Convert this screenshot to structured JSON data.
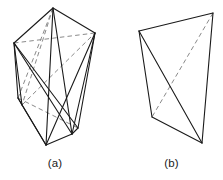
{
  "figure": {
    "background_color": "#ffffff",
    "solid_edge_color": "#1a1a1a",
    "hidden_edge_color": "#8a8a8a",
    "caption_a": "(a)",
    "caption_b": "(b)",
    "panels": [
      {
        "id": "a",
        "label": "(a)",
        "description": "wireframe polyhedron with visible and hidden edges",
        "vertices": [
          {
            "name": "apex",
            "x": 53,
            "y": 8
          },
          {
            "name": "left-upper",
            "x": 14,
            "y": 43
          },
          {
            "name": "right-upper",
            "x": 95,
            "y": 33
          },
          {
            "name": "left-lower",
            "x": 22,
            "y": 105
          },
          {
            "name": "bottom-left",
            "x": 46,
            "y": 145
          },
          {
            "name": "bottom-right",
            "x": 72,
            "y": 134
          },
          {
            "name": "left-mid",
            "x": 18,
            "y": 98
          },
          {
            "name": "right-lower",
            "x": 78,
            "y": 128
          }
        ],
        "solid_edges": [
          [
            53,
            8,
            14,
            43
          ],
          [
            53,
            8,
            95,
            33
          ],
          [
            53,
            8,
            46,
            145
          ],
          [
            53,
            8,
            72,
            134
          ],
          [
            14,
            43,
            22,
            105
          ],
          [
            14,
            43,
            18,
            98
          ],
          [
            14,
            43,
            72,
            134
          ],
          [
            14,
            43,
            78,
            128
          ],
          [
            95,
            33,
            78,
            128
          ],
          [
            95,
            33,
            46,
            145
          ],
          [
            22,
            105,
            46,
            145
          ],
          [
            18,
            98,
            46,
            145
          ],
          [
            46,
            145,
            72,
            134
          ],
          [
            72,
            134,
            78,
            128
          ],
          [
            22,
            105,
            18,
            98
          ],
          [
            72,
            134,
            95,
            33
          ]
        ],
        "dashed_edges": [
          [
            53,
            8,
            22,
            105
          ],
          [
            53,
            8,
            18,
            98
          ],
          [
            14,
            43,
            95,
            33
          ],
          [
            22,
            105,
            95,
            33
          ],
          [
            18,
            98,
            78,
            128
          ]
        ]
      },
      {
        "id": "b",
        "label": "(b)",
        "description": "wireframe tetrahedron with one hidden diagonal",
        "vertices": [
          {
            "name": "top-left",
            "x": 139,
            "y": 31
          },
          {
            "name": "top-right",
            "x": 213,
            "y": 13
          },
          {
            "name": "bottom-left",
            "x": 152,
            "y": 117
          },
          {
            "name": "bottom-right",
            "x": 202,
            "y": 143
          }
        ],
        "solid_edges": [
          [
            139,
            31,
            213,
            13
          ],
          [
            139,
            31,
            152,
            117
          ],
          [
            139,
            31,
            202,
            143
          ],
          [
            213,
            13,
            202,
            143
          ],
          [
            152,
            117,
            202,
            143
          ]
        ],
        "dashed_edges": [
          [
            213,
            13,
            152,
            117
          ]
        ]
      }
    ]
  }
}
